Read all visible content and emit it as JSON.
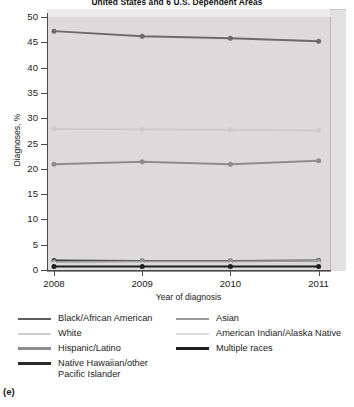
{
  "figure": {
    "label": "(e)",
    "title": "United States and 6 U.S. Dependent Areas"
  },
  "chart_data": {
    "type": "line",
    "title": "United States and 6 U.S. Dependent Areas",
    "xlabel": "Year of diagnosis",
    "ylabel": "Diagnoses, %",
    "categories": [
      "2008",
      "2009",
      "2010",
      "2011"
    ],
    "x": [
      2008,
      2009,
      2010,
      2011
    ],
    "ylim": [
      0,
      50
    ],
    "yticks": [
      0,
      5,
      10,
      15,
      20,
      25,
      30,
      35,
      40,
      45,
      50
    ],
    "grid": false,
    "legend_position": "below",
    "markers": "circle",
    "series": [
      {
        "name": "Black/African American",
        "values": [
          47.2,
          46.2,
          45.8,
          45.2
        ],
        "color": "#6b6b6b"
      },
      {
        "name": "White",
        "values": [
          27.9,
          27.8,
          27.7,
          27.6
        ],
        "color": "#cbcbcb"
      },
      {
        "name": "Hispanic/Latino",
        "values": [
          20.9,
          21.4,
          20.9,
          21.6
        ],
        "color": "#8c8c8c"
      },
      {
        "name": "Native Hawaiian/other\nPacific Islander",
        "values": [
          1.9,
          1.8,
          1.8,
          1.9
        ],
        "color": "#3a3a3a"
      },
      {
        "name": "Asian",
        "values": [
          1.6,
          1.7,
          1.7,
          1.8
        ],
        "color": "#9a9a9a"
      },
      {
        "name": "American Indian/Alaska Native",
        "values": [
          1.2,
          1.1,
          1.1,
          1.2
        ],
        "color": "#d8d8d8"
      },
      {
        "name": "Multiple races",
        "values": [
          0.7,
          0.7,
          0.7,
          0.7
        ],
        "color": "#1f1f1f"
      }
    ]
  },
  "legend": {
    "left_column": [
      {
        "label": "Black/African American",
        "color": "#5e5e5e"
      },
      {
        "label": "White",
        "color": "#cfcfcf"
      },
      {
        "label": "Hispanic/Latino",
        "color": "#8c8c8c"
      },
      {
        "label": "Native Hawaiian/other\nPacific Islander",
        "color": "#2b2b2b"
      }
    ],
    "right_column": [
      {
        "label": "Asian",
        "color": "#9a9a9a"
      },
      {
        "label": "American Indian/Alaska Native",
        "color": "#dcdcdc"
      },
      {
        "label": "Multiple races",
        "color": "#1f1f1f"
      }
    ]
  }
}
